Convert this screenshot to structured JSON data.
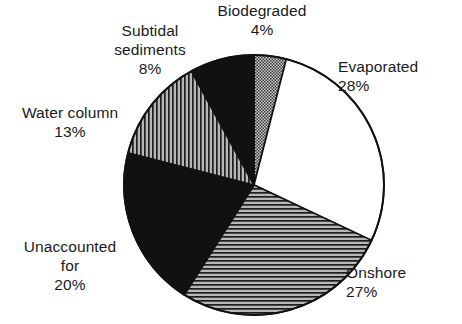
{
  "chart_data": {
    "type": "pie",
    "title": "",
    "subtitle": "",
    "xlabel": "",
    "ylabel": "",
    "legend_position": "none",
    "grid": false,
    "units": "percent",
    "start_angle_deg": 0,
    "direction": "clockwise",
    "categories": [
      "Biodegraded",
      "Evaporated",
      "Onshore",
      "Unaccounted for",
      "Water column",
      "Subtidal sediments"
    ],
    "values": [
      4,
      28,
      27,
      20,
      13,
      8
    ],
    "slices": [
      {
        "label": "Biodegraded",
        "label_lines": [
          "Biodegraded"
        ],
        "value": 4,
        "value_text": "4%",
        "fill": "stipple-dots",
        "fill_color": "#9a9a9a",
        "stroke_color": "#111111",
        "start_deg": 0,
        "end_deg": 14.4
      },
      {
        "label": "Evaporated",
        "label_lines": [
          "Evaporated"
        ],
        "value": 28,
        "value_text": "28%",
        "fill": "solid-white",
        "fill_color": "#ffffff",
        "stroke_color": "#111111",
        "start_deg": 14.4,
        "end_deg": 115.2
      },
      {
        "label": "Onshore",
        "label_lines": [
          "Onshore"
        ],
        "value": 27,
        "value_text": "27%",
        "fill": "horizontal-lines",
        "fill_color": "#8f8f8f",
        "stroke_color": "#111111",
        "start_deg": 115.2,
        "end_deg": 212.4
      },
      {
        "label": "Unaccounted for",
        "label_lines": [
          "Unaccounted",
          "for"
        ],
        "value": 20,
        "value_text": "20%",
        "fill": "solid-black",
        "fill_color": "#111111",
        "stroke_color": "#111111",
        "start_deg": 212.4,
        "end_deg": 284.4
      },
      {
        "label": "Water column",
        "label_lines": [
          "Water column"
        ],
        "value": 13,
        "value_text": "13%",
        "fill": "vertical-lines",
        "fill_color": "#8f8f8f",
        "stroke_color": "#111111",
        "start_deg": 284.4,
        "end_deg": 331.2
      },
      {
        "label": "Subtidal sediments",
        "label_lines": [
          "Subtidal",
          "sediments"
        ],
        "value": 8,
        "value_text": "8%",
        "fill": "solid-black",
        "fill_color": "#111111",
        "stroke_color": "#111111",
        "start_deg": 331.2,
        "end_deg": 360
      }
    ]
  },
  "labels": {
    "biodegraded": {
      "name": "Biodegraded",
      "pct": "4%"
    },
    "evaporated": {
      "name": "Evaporated",
      "pct": "28%"
    },
    "onshore": {
      "name": "Onshore",
      "pct": "27%"
    },
    "unaccounted": {
      "name_line1": "Unaccounted",
      "name_line2": "for",
      "pct": "20%"
    },
    "water_column": {
      "name": "Water column",
      "pct": "13%"
    },
    "subtidal": {
      "name_line1": "Subtidal",
      "name_line2": "sediments",
      "pct": "8%"
    }
  },
  "colors": {
    "ink": "#1a1a1a",
    "outline": "#111111",
    "black_fill": "#111111",
    "white_fill": "#ffffff",
    "hatch_gray": "#8f8f8f",
    "stipple_gray": "#9a9a9a",
    "background": "#ffffff"
  }
}
